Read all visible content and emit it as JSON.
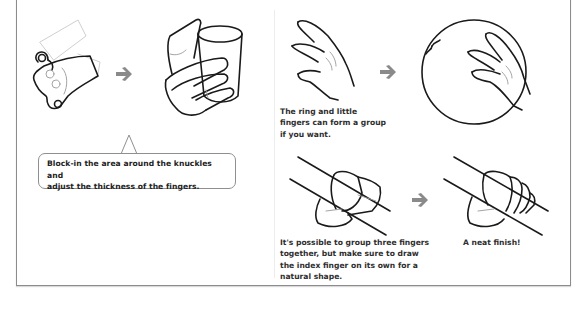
{
  "page": {
    "type": "drawing-tutorial-page",
    "topic": "hands gripping objects"
  },
  "left_panel": {
    "step_arrow_icon": "right-arrow-icon",
    "illustrations": [
      {
        "name": "knuckle-block-in-sketch",
        "description": "Simplified hand block-in with knuckle circles"
      },
      {
        "name": "hand-holding-cup",
        "description": "Finished hand holding a cup"
      }
    ],
    "callout": {
      "lines": [
        "Block-in the area around the knuckles and",
        "adjust the thickness of the fingers."
      ]
    }
  },
  "right_panel": {
    "step_arrow_icon": "right-arrow-icon",
    "top_row": {
      "illustrations": [
        {
          "name": "hand-grouped-fingers",
          "description": "Hand with ring and little fingers grouped"
        },
        {
          "name": "hand-on-ball",
          "description": "Hand resting on a sphere"
        }
      ],
      "caption": {
        "lines": [
          "The ring and little",
          "fingers can form a group",
          "if you want."
        ]
      }
    },
    "bottom_row": {
      "illustrations": [
        {
          "name": "fist-grouped-fingers",
          "description": "Fist gripping a pole with three fingers grouped"
        },
        {
          "name": "fist-finished",
          "description": "Finished fist gripping a pole"
        }
      ],
      "captions": [
        {
          "lines": [
            "It's possible to group three fingers",
            "together, but make sure to draw",
            "the index finger on its own for a",
            "natural shape."
          ]
        },
        {
          "lines": [
            "A neat finish!"
          ]
        }
      ]
    }
  },
  "colors": {
    "line_art": "#1a1a1a",
    "arrow": "#8a8a8a",
    "frame": "#8c8c8c",
    "text": "#2e2e2e"
  }
}
